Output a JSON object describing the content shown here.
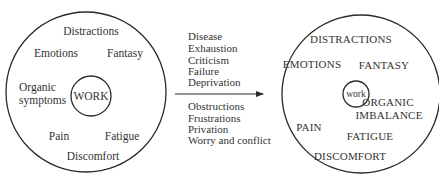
{
  "colors": {
    "stroke": "#2a2a2a",
    "text": "#333333",
    "background": "#ffffff"
  },
  "left_diagram": {
    "center_label": "WORK",
    "labels": {
      "top": "Distractions",
      "upper_left": "Emotions",
      "upper_right": "Fantasy",
      "left_line1": "Organic",
      "left_line2": "symptoms",
      "lower_left": "Pain",
      "lower_right": "Fatigue",
      "bottom": "Discomfort"
    }
  },
  "arrow": {
    "above": [
      "Disease",
      "Exhaustion",
      "Criticism",
      "Failure",
      "Deprivation"
    ],
    "below": [
      "Obstructions",
      "Frustrations",
      "Privation",
      "Worry and conflict"
    ]
  },
  "right_diagram": {
    "center_label": "work",
    "labels": {
      "top": "DISTRACTIONS",
      "upper_left": "EMOTIONS",
      "upper_right": "FANTASY",
      "right_line1": "ORGANIC",
      "right_line2": "IMBALANCE",
      "lower_left": "PAIN",
      "lower_right": "FATIGUE",
      "bottom": "DISCOMFORT"
    }
  }
}
